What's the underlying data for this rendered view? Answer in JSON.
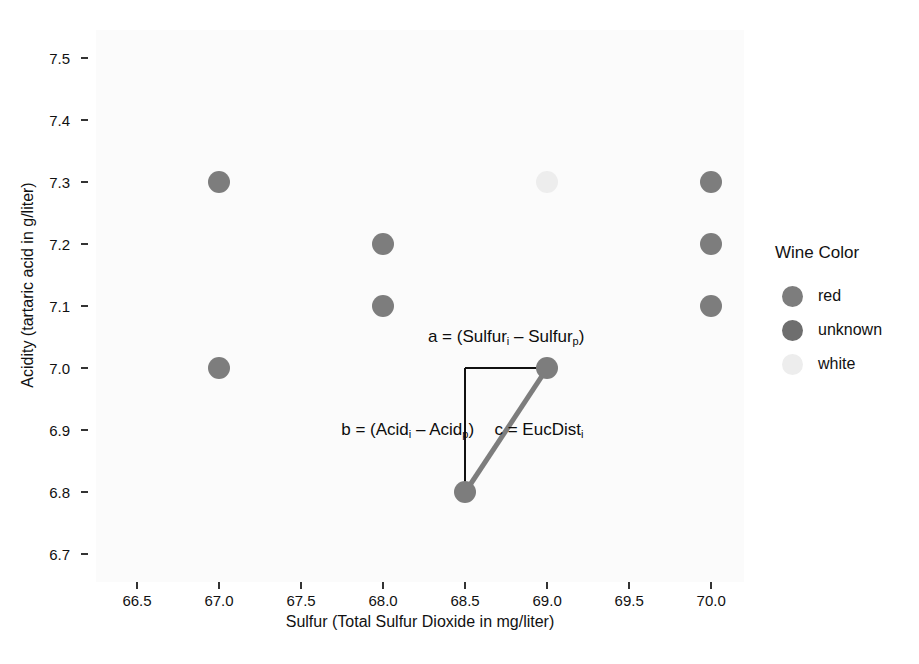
{
  "chart_data": {
    "type": "scatter",
    "title": "",
    "xlabel": "Sulfur (Total Sulfur Dioxide  in mg/liter)",
    "ylabel": "Acidity (tartaric acid in g/liter)",
    "xlim": [
      66.25,
      70.2
    ],
    "ylim": [
      6.655,
      7.545
    ],
    "xticks": [
      "66.5",
      "67.0",
      "67.5",
      "68.0",
      "68.5",
      "69.0",
      "69.5",
      "70.0"
    ],
    "xtick_values": [
      66.5,
      67.0,
      67.5,
      68.0,
      68.5,
      69.0,
      69.5,
      70.0
    ],
    "yticks": [
      "7.5",
      "7.4",
      "7.3",
      "7.2",
      "7.1",
      "7.0",
      "6.9",
      "6.8",
      "6.7"
    ],
    "ytick_values": [
      7.5,
      7.4,
      7.3,
      7.2,
      7.1,
      7.0,
      6.9,
      6.8,
      6.7
    ],
    "grid": false,
    "legend_position": "right",
    "series": [
      {
        "name": "red",
        "color": "#7d7d7d",
        "points": [
          {
            "x": 67.0,
            "y": 7.3
          },
          {
            "x": 67.0,
            "y": 7.0
          },
          {
            "x": 68.0,
            "y": 7.2
          },
          {
            "x": 68.0,
            "y": 7.1
          },
          {
            "x": 68.5,
            "y": 6.8
          },
          {
            "x": 69.0,
            "y": 7.0
          },
          {
            "x": 70.0,
            "y": 7.3
          },
          {
            "x": 70.0,
            "y": 7.2
          },
          {
            "x": 70.0,
            "y": 7.1
          }
        ]
      },
      {
        "name": "unknown",
        "color": "#6e6e6e",
        "points": []
      },
      {
        "name": "white",
        "color": "#ededed",
        "points": [
          {
            "x": 69.0,
            "y": 7.3
          }
        ]
      }
    ],
    "annotations": [
      {
        "id": "a",
        "html": "a = (Sulfur<sub>i</sub> &ndash; Sulfur<sub>p</sub>)",
        "text": "a = (Sulfur_i – Sulfur_p)",
        "x": 68.75,
        "y": 7.05
      },
      {
        "id": "b",
        "html": "b = (Acid<sub>i</sub> &ndash; Acid<sub>p</sub>)",
        "text": "b = (Acid_i – Acid_p)",
        "x": 68.15,
        "y": 6.9
      },
      {
        "id": "c",
        "html": "c = EucDist<sub>i</sub>",
        "text": "c = EucDist_i",
        "x": 68.95,
        "y": 6.9
      }
    ],
    "segments": [
      {
        "id": "a-segment",
        "x1": 68.5,
        "y1": 7.0,
        "x2": 69.0,
        "y2": 7.0,
        "color": "#111111",
        "width": 2
      },
      {
        "id": "b-segment",
        "x1": 68.5,
        "y1": 7.0,
        "x2": 68.5,
        "y2": 6.8,
        "color": "#111111",
        "width": 2
      },
      {
        "id": "c-segment",
        "x1": 68.5,
        "y1": 6.8,
        "x2": 69.0,
        "y2": 7.0,
        "color": "#7d7d7d",
        "width": 5
      }
    ]
  },
  "legend": {
    "title": "Wine Color",
    "items": [
      {
        "label": "red",
        "color": "#7d7d7d"
      },
      {
        "label": "unknown",
        "color": "#6e6e6e"
      },
      {
        "label": "white",
        "color": "#ededed"
      }
    ]
  },
  "style": {
    "panel_background": "#fbfbfb",
    "point_radius": 11,
    "axis_text_color": "#111111"
  }
}
